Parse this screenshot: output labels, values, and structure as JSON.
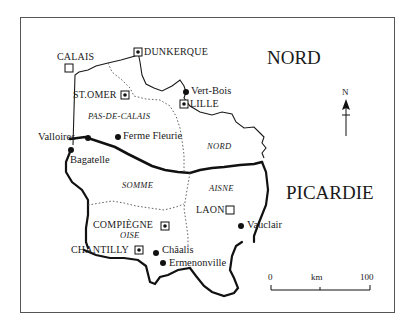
{
  "map": {
    "regions": [
      {
        "label": "NORD"
      },
      {
        "label": "PICARDIE"
      }
    ],
    "departments": [
      {
        "label": "PAS-DE-CALAIS"
      },
      {
        "label": "NORD"
      },
      {
        "label": "SOMME"
      },
      {
        "label": "AISNE"
      },
      {
        "label": "OISE"
      }
    ],
    "cities": [
      {
        "label": "CALAIS",
        "symbol": "open-square"
      },
      {
        "label": "DUNKERQUE",
        "symbol": "dotted-square"
      },
      {
        "label": "ST.OMER",
        "symbol": "dotted-square"
      },
      {
        "label": "LILLE",
        "symbol": "dotted-square"
      },
      {
        "label": "LAON",
        "symbol": "open-square"
      },
      {
        "label": "COMPIÈGNE",
        "symbol": "dotted-square"
      },
      {
        "label": "CHANTILLY",
        "symbol": "dotted-square"
      }
    ],
    "sites": [
      {
        "label": "Vert-Bois"
      },
      {
        "label": "Valloires"
      },
      {
        "label": "Ferme Fleurie"
      },
      {
        "label": "Bagatelle"
      },
      {
        "label": "Vauclair"
      },
      {
        "label": "Châalis"
      },
      {
        "label": "Ermenonville"
      }
    ],
    "north_arrow": {
      "label": "N"
    },
    "scale_bar": {
      "start": "0",
      "unit": "km",
      "end": "100"
    }
  }
}
